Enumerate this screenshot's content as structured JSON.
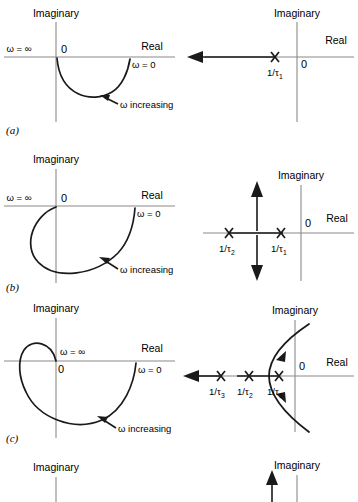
{
  "figure": {
    "axis_labels": {
      "imaginary": "Imaginary",
      "real": "Real"
    },
    "origin_label": "0"
  },
  "rows": [
    {
      "caption": "(a)",
      "nyquist": {
        "axis_imaginary": "Imaginary",
        "axis_real": "Real",
        "origin": "0",
        "omega_infinity": "ω = ∞",
        "omega_zero": "ω = 0",
        "direction": "ω increasing",
        "shape": "single semicircular arc below real axis from ω=0 on positive real axis to origin"
      },
      "splane": {
        "axis_imaginary": "Imaginary",
        "axis_real": "Real",
        "origin": "0",
        "poles": [
          {
            "label": "1/τ",
            "sub": "1",
            "x_rel": -0.45
          }
        ],
        "locus": "single branch along negative real axis travelling left to infinity"
      }
    },
    {
      "caption": "(b)",
      "nyquist": {
        "axis_imaginary": "Imaginary",
        "axis_real": "Real",
        "origin": "0",
        "omega_infinity": "ω = ∞",
        "omega_zero": "ω = 0",
        "direction": "ω increasing",
        "shape": "arc sweeping through third and fourth quadrants, entering left of imaginary axis before returning to origin"
      },
      "splane": {
        "axis_imaginary": "Imaginary",
        "axis_real": "Real",
        "origin": "0",
        "poles": [
          {
            "label": "1/τ",
            "sub": "2",
            "x_rel": -0.9
          },
          {
            "label": "1/τ",
            "sub": "1",
            "x_rel": -0.4
          }
        ],
        "locus": "branches break away between the two poles and travel vertically up and down"
      }
    },
    {
      "caption": "(c)",
      "nyquist": {
        "axis_imaginary": "Imaginary",
        "axis_real": "Real",
        "origin": "0",
        "omega_infinity": "ω = ∞",
        "omega_zero": "ω = 0",
        "direction": "ω increasing",
        "shape": "large arc through third and fourth quadrants plus a small loop above the real axis in the second quadrant returning to origin"
      },
      "splane": {
        "axis_imaginary": "Imaginary",
        "axis_real": "Real",
        "origin": "0",
        "poles": [
          {
            "label": "1/τ",
            "sub": "3",
            "x_rel": -1.35
          },
          {
            "label": "1/τ",
            "sub": "2",
            "x_rel": -0.82
          },
          {
            "label": "1/τ",
            "sub": "1",
            "x_rel": -0.32
          }
        ],
        "locus": "one branch to the left along the real axis, two branches breaking away and curving across the imaginary axis"
      }
    },
    {
      "caption": "",
      "nyquist": {
        "axis_imaginary": "Imaginary",
        "axis_real": "",
        "origin": "",
        "omega_infinity": "",
        "omega_zero": "",
        "direction": "",
        "shape": "cut off at bottom edge of image"
      },
      "splane": {
        "axis_imaginary": "Imaginary",
        "axis_real": "",
        "origin": "",
        "poles": [],
        "locus": "vertical arrow pointing upward, cut off at bottom edge of image"
      }
    }
  ]
}
